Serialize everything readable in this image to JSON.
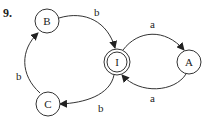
{
  "problem_number": "9.",
  "colors": {
    "stroke": "#333333",
    "text": "#222222",
    "background": "#ffffff"
  },
  "nodes": [
    {
      "id": "B",
      "label": "B",
      "accepting": false
    },
    {
      "id": "I",
      "label": "I",
      "accepting": true
    },
    {
      "id": "A",
      "label": "A",
      "accepting": false
    },
    {
      "id": "C",
      "label": "C",
      "accepting": false
    }
  ],
  "edges": [
    {
      "from": "B",
      "to": "I",
      "label": "b"
    },
    {
      "from": "I",
      "to": "A",
      "label": "a"
    },
    {
      "from": "A",
      "to": "I",
      "label": "a"
    },
    {
      "from": "I",
      "to": "C",
      "label": "b"
    },
    {
      "from": "C",
      "to": "B",
      "label": "b"
    }
  ]
}
